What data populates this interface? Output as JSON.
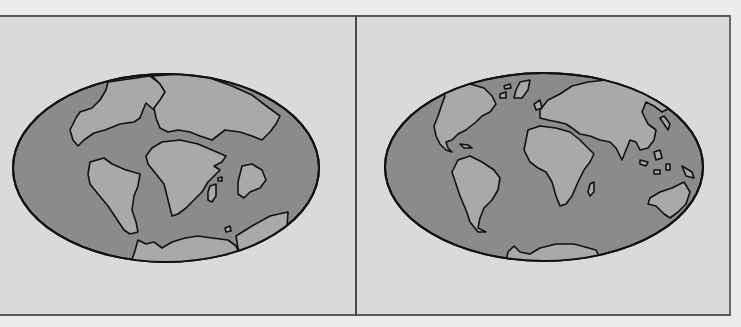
{
  "figure": {
    "panels": [
      {
        "id": "past",
        "description": "Mollweide-style world map showing continents clustered (ancient supercontinent breakup)",
        "colors": {
          "background": "#dadada",
          "ocean": "#8b8b8b",
          "land": "#a9a9a9",
          "outline": "#111111"
        }
      },
      {
        "id": "present",
        "description": "Mollweide-style world map showing present-day continents",
        "colors": {
          "background": "#dadada",
          "ocean": "#8b8b8b",
          "land": "#a9a9a9",
          "outline": "#111111"
        }
      }
    ]
  }
}
